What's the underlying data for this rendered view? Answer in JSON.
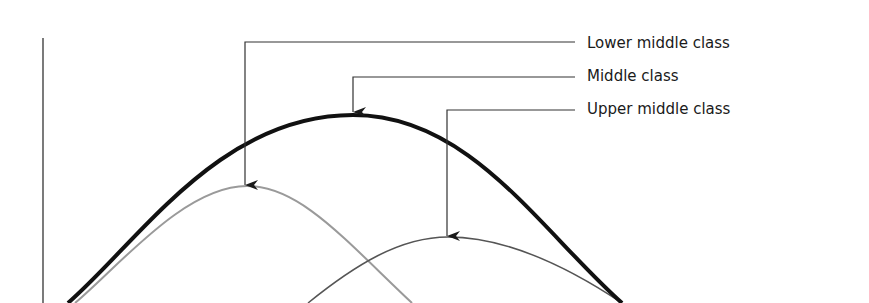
{
  "diagram": {
    "labels": [
      {
        "id": "lower",
        "text": "Lower middle class",
        "x": 587,
        "y": 35
      },
      {
        "id": "middle",
        "text": "Middle class",
        "x": 587,
        "y": 68
      },
      {
        "id": "upper",
        "text": "Upper middle class",
        "x": 587,
        "y": 101
      }
    ],
    "curves": [
      {
        "id": "middle",
        "name": "Middle class",
        "color": "#111111",
        "width": 4,
        "peak": [
          353,
          115
        ],
        "start": [
          68,
          303
        ],
        "end": [
          622,
          303
        ]
      },
      {
        "id": "lower",
        "name": "Lower middle class",
        "color": "#9a9a9a",
        "width": 2,
        "peak": [
          247,
          186
        ],
        "start": [
          75,
          303
        ],
        "end": [
          412,
          303
        ]
      },
      {
        "id": "upper",
        "name": "Upper middle class",
        "color": "#555555",
        "width": 1.5,
        "peak": [
          448,
          237
        ],
        "start": [
          308,
          303
        ],
        "end": [
          622,
          303
        ]
      }
    ],
    "colors": {
      "axis": "#333333",
      "leader": "#333333",
      "text": "#1a1a1a"
    }
  }
}
